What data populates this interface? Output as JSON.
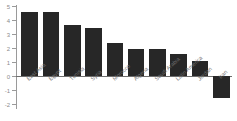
{
  "chart_data": {
    "type": "bar",
    "title": "",
    "subtitle": "",
    "xlabel": "",
    "ylabel": "",
    "ylim": [
      -2,
      5
    ],
    "yticks": [
      5,
      4,
      3,
      2,
      1,
      0,
      -1,
      -2
    ],
    "ytick_labels": [
      "5",
      "4",
      "3",
      "2",
      "1",
      "0",
      "-1",
      "-2"
    ],
    "grid": false,
    "legend": false,
    "bar_color": "#272727",
    "axis_color": "#9a9a9a",
    "label_color": "#6f6f6f",
    "categories": [
      "East Asia",
      "Egypt",
      "Tunisia",
      "Syria",
      "Morocco",
      "Algeria",
      "Saudi Arabia",
      "Latin America",
      "Jordan",
      "Iran"
    ],
    "values": [
      4.55,
      4.55,
      3.65,
      3.45,
      2.35,
      1.9,
      1.9,
      1.6,
      1.05,
      -1.6
    ]
  }
}
